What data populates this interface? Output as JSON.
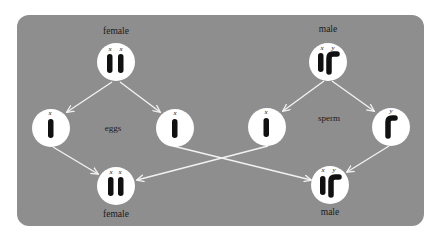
{
  "colors": {
    "background": "#ffffff",
    "panel": "#8e8e8e",
    "circle": "#ffffff",
    "chromosome": "#111111",
    "arrow": "#f2f2f2",
    "text": "#1a1a1a"
  },
  "parents": {
    "female": {
      "label": "female",
      "chromosomes": [
        "x",
        "x"
      ]
    },
    "male": {
      "label": "male",
      "chromosomes": [
        "x",
        "y"
      ]
    }
  },
  "gametes": {
    "eggs": {
      "label": "eggs",
      "items": [
        {
          "chromosome": "x"
        },
        {
          "chromosome": "x"
        }
      ]
    },
    "sperm": {
      "label": "sperm",
      "items": [
        {
          "chromosome": "x"
        },
        {
          "chromosome": "y"
        }
      ]
    }
  },
  "offspring": {
    "female": {
      "label": "female",
      "chromosomes": [
        "x",
        "x"
      ]
    },
    "male": {
      "label": "male",
      "chromosomes": [
        "x",
        "y"
      ]
    }
  }
}
